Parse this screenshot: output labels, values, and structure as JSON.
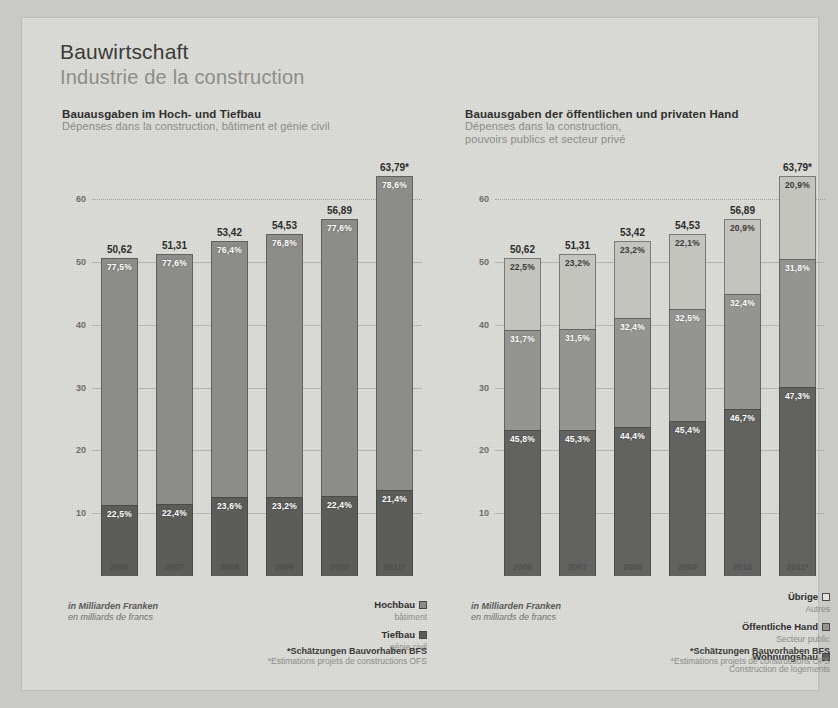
{
  "header": {
    "title_de": "Bauwirtschaft",
    "title_fr": "Industrie de la construction"
  },
  "footnote": {
    "de": "*Schätzungen Bauvorhaben BFS",
    "fr": "*Estimations projets de constructions OFS"
  },
  "axis_unit": {
    "de": "in Milliarden Franken",
    "fr": "en milliards de francs"
  },
  "colors": {
    "hochbau": "#8c8c88",
    "tiefbau": "#5c5c59",
    "uebrige": "#c4c4bf",
    "oeffentliche_hand": "#949490",
    "wohnungsbau": "#626260",
    "paper": "#dcdcd8",
    "background": "#c9c9c5"
  },
  "chart_data": [
    {
      "id": "left",
      "type": "bar",
      "stacked": true,
      "title": "Bauausgaben im Hoch- und Tiefbau",
      "subtitle": "Dépenses dans la construction, bâtiment et génie civil",
      "xlabel": "",
      "ylabel": "in Milliarden Franken",
      "ylim": [
        0,
        65
      ],
      "yticks": [
        10,
        20,
        30,
        40,
        50,
        60
      ],
      "grid": true,
      "legend_position": "bottom-right",
      "categories": [
        "2006",
        "2007",
        "2008",
        "2009",
        "2010",
        "2011*"
      ],
      "totals": [
        "50,62",
        "51,31",
        "53,42",
        "54,53",
        "56,89",
        "63,79*"
      ],
      "totals_numeric": [
        50.62,
        51.31,
        53.42,
        54.53,
        56.89,
        63.79
      ],
      "series": [
        {
          "name": "Hochbau",
          "name_fr": "bâtiment",
          "color": "#8c8c88",
          "percent_labels": [
            "77,5%",
            "77,6%",
            "76,4%",
            "76,8%",
            "77,6%",
            "78,6%"
          ],
          "percent_values": [
            77.5,
            77.6,
            76.4,
            76.8,
            77.6,
            78.6
          ]
        },
        {
          "name": "Tiefbau",
          "name_fr": "génie civil",
          "color": "#5c5c59",
          "percent_labels": [
            "22,5%",
            "22,4%",
            "23,6%",
            "23,2%",
            "22,4%",
            "21,4%"
          ],
          "percent_values": [
            22.5,
            22.4,
            23.6,
            23.2,
            22.4,
            21.4
          ]
        }
      ]
    },
    {
      "id": "right",
      "type": "bar",
      "stacked": true,
      "title": "Bauausgaben der öffentlichen und privaten Hand",
      "subtitle": "Dépenses dans la construction,\npouvoirs publics et secteur privé",
      "subtitle_line1": "Dépenses dans la construction,",
      "subtitle_line2": "pouvoirs publics et secteur privé",
      "xlabel": "",
      "ylabel": "in Milliarden Franken",
      "ylim": [
        0,
        65
      ],
      "yticks": [
        10,
        20,
        30,
        40,
        50,
        60
      ],
      "grid": true,
      "legend_position": "bottom-right",
      "categories": [
        "2006",
        "2007",
        "2008",
        "2009",
        "2010",
        "2011*"
      ],
      "totals": [
        "50,62",
        "51,31",
        "53,42",
        "54,53",
        "56,89",
        "63,79*"
      ],
      "totals_numeric": [
        50.62,
        51.31,
        53.42,
        54.53,
        56.89,
        63.79
      ],
      "series": [
        {
          "name": "Übrige",
          "name_fr": "Autres",
          "color": "#c4c4bf",
          "percent_labels": [
            "22,5%",
            "23,2%",
            "23,2%",
            "22,1%",
            "20,9%",
            "20,9%"
          ],
          "percent_values": [
            22.5,
            23.2,
            23.2,
            22.1,
            20.9,
            20.9
          ]
        },
        {
          "name": "Öffentliche Hand",
          "name_fr": "Secteur public",
          "color": "#949490",
          "percent_labels": [
            "31,7%",
            "31,5%",
            "32,4%",
            "32,5%",
            "32,4%",
            "31,8%"
          ],
          "percent_values": [
            31.7,
            31.5,
            32.4,
            32.5,
            32.4,
            31.8
          ]
        },
        {
          "name": "Wohnungsbau",
          "name_fr": "Construction de logements",
          "color": "#626260",
          "percent_labels": [
            "45,8%",
            "45,3%",
            "44,4%",
            "45,4%",
            "46,7%",
            "47,3%"
          ],
          "percent_values": [
            45.8,
            45.3,
            44.4,
            45.4,
            46.7,
            47.3
          ]
        }
      ]
    }
  ]
}
